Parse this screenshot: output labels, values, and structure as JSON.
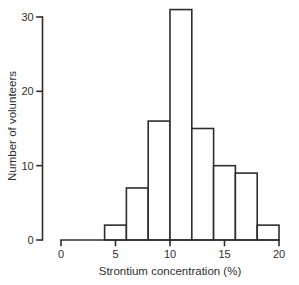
{
  "figure": {
    "background": "#ffffff"
  },
  "chart_data": {
    "type": "bar",
    "subtype": "histogram",
    "xlabel": "Strontium concentration (%)",
    "ylabel": "Number of volunteers",
    "bin_edges": [
      4,
      6,
      8,
      10,
      12,
      14,
      16,
      18,
      20
    ],
    "counts": [
      2,
      7,
      16,
      31,
      15,
      10,
      9,
      2
    ],
    "x_ticks": [
      "0",
      "5",
      "10",
      "15",
      "20"
    ],
    "x_tick_values": [
      0,
      5,
      10,
      15,
      20
    ],
    "y_ticks": [
      "0",
      "10",
      "20",
      "30"
    ],
    "y_tick_values": [
      0,
      10,
      20,
      30
    ],
    "xlim": [
      0,
      20
    ],
    "ylim": [
      0,
      30
    ],
    "grid": false,
    "legend": "none",
    "bar_fill": "#ffffff",
    "line_color": "#2e2e2e",
    "text_color": "#2f2f2f",
    "background": "#ffffff"
  }
}
